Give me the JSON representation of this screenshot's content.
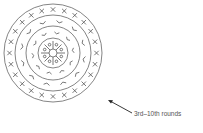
{
  "diagram": {
    "type": "concentric-round-pattern",
    "center": [
      53,
      53
    ],
    "rings": [
      {
        "name": "outer-ring",
        "radius": 49
      },
      {
        "name": "third-ring",
        "radius": 38
      },
      {
        "name": "second-ring",
        "radius": 27
      },
      {
        "name": "inner-ring",
        "radius": 15
      },
      {
        "name": "center-ring",
        "radius": 4
      }
    ],
    "bands": [
      {
        "name": "outer-band",
        "mark": "x",
        "count": 24
      },
      {
        "name": "middle-band",
        "mark": "v",
        "count": 12
      },
      {
        "name": "inner-band",
        "mark": "spoke",
        "count": 8
      }
    ],
    "stroke_color": "#666666"
  },
  "annotation": {
    "label": "3rd–10th rounds",
    "arrow_from": [
      132,
      113
    ],
    "arrow_to": [
      108,
      100
    ]
  }
}
